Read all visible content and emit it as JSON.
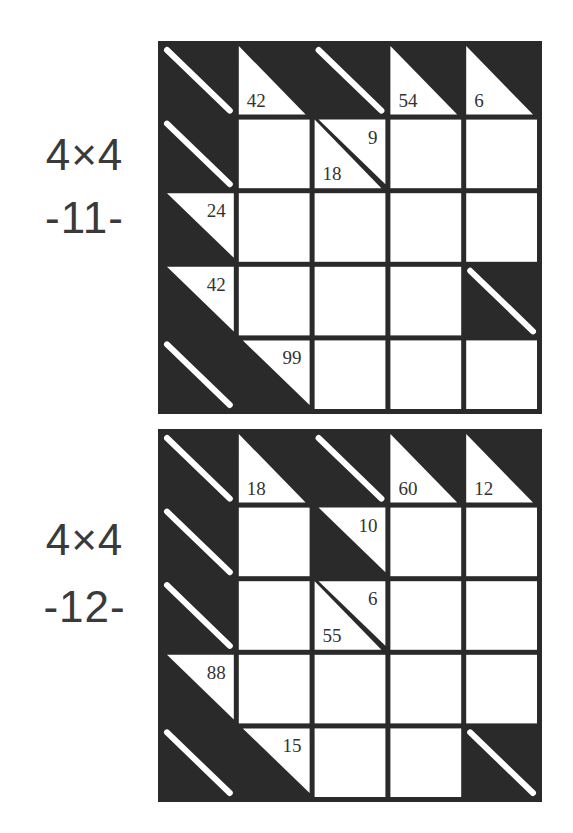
{
  "puzzles": [
    {
      "size_label": "4×4",
      "number_label": "-11-",
      "grid": {
        "rows": 5,
        "cols": 5,
        "cells": [
          [
            {
              "type": "blank"
            },
            {
              "type": "clue",
              "down": "42"
            },
            {
              "type": "blank"
            },
            {
              "type": "clue",
              "down": "54"
            },
            {
              "type": "clue",
              "down": "6"
            }
          ],
          [
            {
              "type": "blank"
            },
            {
              "type": "white"
            },
            {
              "type": "clue",
              "right": "9",
              "down": "18"
            },
            {
              "type": "white"
            },
            {
              "type": "white"
            }
          ],
          [
            {
              "type": "clue",
              "right": "24"
            },
            {
              "type": "white"
            },
            {
              "type": "white"
            },
            {
              "type": "white"
            },
            {
              "type": "white"
            }
          ],
          [
            {
              "type": "clue",
              "right": "42"
            },
            {
              "type": "white"
            },
            {
              "type": "white"
            },
            {
              "type": "white"
            },
            {
              "type": "blank"
            }
          ],
          [
            {
              "type": "blank"
            },
            {
              "type": "clue",
              "right": "99"
            },
            {
              "type": "white"
            },
            {
              "type": "white"
            },
            {
              "type": "white"
            }
          ]
        ]
      }
    },
    {
      "size_label": "4×4",
      "number_label": "-12-",
      "grid": {
        "rows": 5,
        "cols": 5,
        "cells": [
          [
            {
              "type": "blank"
            },
            {
              "type": "clue",
              "down": "18"
            },
            {
              "type": "blank"
            },
            {
              "type": "clue",
              "down": "60"
            },
            {
              "type": "clue",
              "down": "12"
            }
          ],
          [
            {
              "type": "blank"
            },
            {
              "type": "white"
            },
            {
              "type": "clue",
              "right": "10"
            },
            {
              "type": "white"
            },
            {
              "type": "white"
            }
          ],
          [
            {
              "type": "blank"
            },
            {
              "type": "white"
            },
            {
              "type": "clue",
              "right": "6",
              "down": "55"
            },
            {
              "type": "white"
            },
            {
              "type": "white"
            }
          ],
          [
            {
              "type": "clue",
              "right": "88"
            },
            {
              "type": "white"
            },
            {
              "type": "white"
            },
            {
              "type": "white"
            },
            {
              "type": "white"
            }
          ],
          [
            {
              "type": "blank"
            },
            {
              "type": "clue",
              "right": "15"
            },
            {
              "type": "white"
            },
            {
              "type": "white"
            },
            {
              "type": "blank"
            }
          ]
        ]
      }
    }
  ],
  "colors": {
    "ink": "#2a2a2a",
    "paper": "#ffffff",
    "text": "#333333"
  }
}
